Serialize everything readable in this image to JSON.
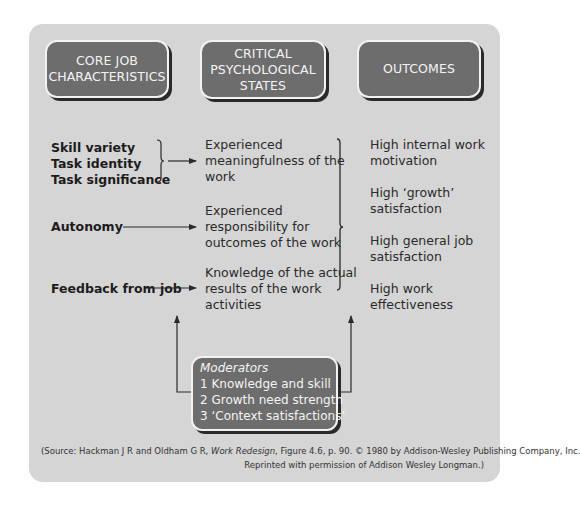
{
  "headers": [
    {
      "label": "CORE JOB\nCHARACTERISTICS"
    },
    {
      "label": "CRITICAL\nPSYCHOLOGICAL\nSTATES"
    },
    {
      "label": "OUTCOMES"
    }
  ],
  "core_characteristics": [
    "Skill variety",
    "Task identity",
    "Task significance",
    "Autonomy",
    "Feedback from job"
  ],
  "psychological_states": [
    {
      "lines": [
        "Experienced",
        "meaningfulness of the",
        "work"
      ]
    },
    {
      "lines": [
        "Experienced",
        "responsibility for",
        "outcomes of the work"
      ]
    },
    {
      "lines": [
        "Knowledge of the actual",
        "results of the work",
        "activities"
      ]
    }
  ],
  "outcomes": [
    {
      "lines": [
        "High internal work",
        "motivation"
      ]
    },
    {
      "lines": [
        "High ‘growth’",
        "satisfaction"
      ]
    },
    {
      "lines": [
        "High general job",
        "satisfaction"
      ]
    },
    {
      "lines": [
        "High work",
        "effectiveness"
      ]
    }
  ],
  "moderators": {
    "title": "Moderators",
    "items": [
      "1 Knowledge and skill",
      "2 Growth need strength",
      "3 ‘Context satisfactions’"
    ]
  },
  "source": {
    "prefix": "(Source:",
    "line1_a": " Hackman J R and Oldham G R, ",
    "line1_italic": "Work Redesign",
    "line1_b": ", Figure 4.6, p. 90. ©  1980 by Addison-Wesley Publishing Company, Inc.",
    "line2": "Reprinted with permission of Addison Wesley Longman.)"
  },
  "colors": {
    "panel": "#d5d5d5",
    "box_fill": "#6d6d6d",
    "box_text": "#f4f4f4",
    "line": "#2a2a2a"
  }
}
